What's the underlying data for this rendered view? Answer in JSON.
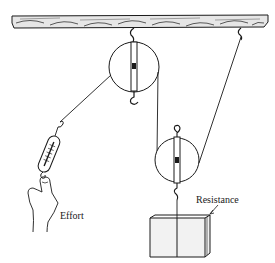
{
  "diagram": {
    "type": "pulley-system",
    "components": {
      "beam": "wooden-ceiling-beam",
      "fixed_pulley": "fixed-pulley",
      "movable_pulley": "movable-pulley",
      "spring_scale": "spring-scale",
      "hand": "hand",
      "load": "box"
    },
    "labels": {
      "effort": "Effort",
      "resistance": "Resistance"
    },
    "colors": {
      "ink": "#1a1a1a",
      "background": "#ffffff",
      "wood_fill": "#e6e6e6",
      "box_fill": "#f2f2f2"
    }
  }
}
